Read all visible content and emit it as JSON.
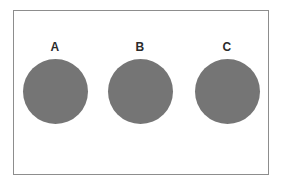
{
  "figure": {
    "background_color": "#ffffff",
    "panel": {
      "border_color": "#8d8d8d",
      "fill_color": "#ffffff"
    },
    "label_color": "#2b2b2b",
    "groups": [
      {
        "id": "a",
        "label": "A",
        "shape": "circle",
        "fill_color": "#757575",
        "diameter_px": 65,
        "center_x_px": 55,
        "center_y_px": 91
      },
      {
        "id": "b",
        "label": "B",
        "shape": "circle",
        "fill_color": "#757575",
        "diameter_px": 65,
        "center_x_px": 140,
        "center_y_px": 91
      },
      {
        "id": "c",
        "label": "C",
        "shape": "circle",
        "fill_color": "#757575",
        "diameter_px": 65,
        "center_x_px": 227,
        "center_y_px": 91
      }
    ]
  },
  "chart_data": {
    "type": "scatter",
    "title": "",
    "xlabel": "",
    "ylabel": "",
    "categories": [
      "A",
      "B",
      "C"
    ],
    "values": [
      65,
      65,
      65
    ],
    "series": [
      {
        "name": "marker diameter (px)",
        "values": [
          65,
          65,
          65
        ]
      }
    ],
    "marker": {
      "shape": "circle",
      "color": "#757575"
    },
    "grid": false,
    "legend": "none",
    "annotations": [
      "A",
      "B",
      "C"
    ]
  }
}
